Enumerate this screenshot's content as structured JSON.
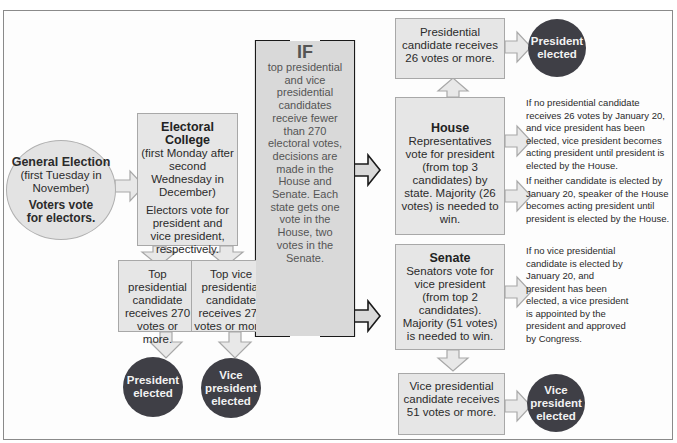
{
  "general_election": {
    "title": "General Election",
    "when": "(first Tuesday in November)",
    "action": "Voters vote for electors."
  },
  "electoral_college": {
    "title": "Electoral College",
    "when": "(first Monday after second Wednesday in December)",
    "action": "Electors vote for president and vice president, respectively."
  },
  "top_president": {
    "text": "Top presidential candidate receives 270 votes or more."
  },
  "top_vice": {
    "text": "Top vice presidential candidate receives 270 votes or more."
  },
  "president_elected_1": {
    "label": "President elected"
  },
  "vice_elected_1": {
    "label": "Vice president elected"
  },
  "if_box": {
    "heading": "IF",
    "text": "top presidential and vice presidential candidates receive fewer than 270 electoral votes, decisions are made in the House and Senate. Each state gets one vote in the House, two votes in the Senate."
  },
  "house_result": {
    "text": "Presidential candidate receives 26 votes or more."
  },
  "president_elected_2": {
    "label": "President elected"
  },
  "house": {
    "title": "House",
    "text": "Representatives vote for president (from top 3 candidates) by state. Majority (26 votes) is needed to win."
  },
  "senate": {
    "title": "Senate",
    "text": "Senators vote for vice president (from top 2 candidates). Majority (51 votes) is needed to win."
  },
  "senate_result": {
    "text": "Vice presidential candidate receives 51 votes or more."
  },
  "vice_elected_2": {
    "label": "Vice president elected"
  },
  "notes": [
    "If no presidential candidate receives 26 votes by January 20, and vice president has been elected, vice president becomes acting president until president is elected by the House.",
    "If neither candidate is elected by January 20, speaker of the House becomes acting president until president is elected by the House.",
    "If no vice presidential candidate is elected by January 20, and president has been elected, a vice president is appointed by the president and approved by Congress."
  ],
  "colors": {
    "box_fill": "#e6e6e6",
    "box_border": "#a8a8a8",
    "circle_fill": "#3f3f46",
    "if_fill": "#d9d9d9",
    "frame": "#8a8a8a"
  }
}
